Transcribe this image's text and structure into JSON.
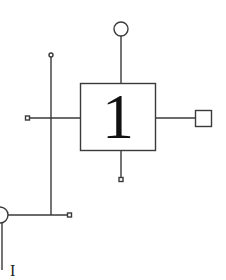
{
  "diagram": {
    "type": "block-schematic",
    "block": {
      "label": "1",
      "x": 80,
      "y": 83,
      "width": 76,
      "height": 68
    },
    "terminals": [
      {
        "id": "top",
        "shape": "circle-large",
        "cx": 121,
        "cy": 29,
        "r": 7
      },
      {
        "id": "right",
        "shape": "square-large",
        "x": 195,
        "y": 110,
        "size": 16
      },
      {
        "id": "left",
        "shape": "square-small",
        "x": 25,
        "y": 116,
        "size": 4
      },
      {
        "id": "bottom",
        "shape": "square-small",
        "x": 119,
        "y": 177,
        "size": 4
      },
      {
        "id": "bus-top",
        "shape": "circle-small",
        "cx": 51,
        "cy": 55,
        "r": 2
      },
      {
        "id": "bus-right",
        "shape": "square-small",
        "x": 67,
        "y": 213,
        "size": 4
      },
      {
        "id": "bus-left",
        "shape": "circle-large",
        "cx": 0,
        "cy": 215,
        "r": 8
      }
    ],
    "colors": {
      "line": "#3a3a3a",
      "background": "#ffffff",
      "label": "#111111"
    },
    "footer_text_partial": "I"
  }
}
